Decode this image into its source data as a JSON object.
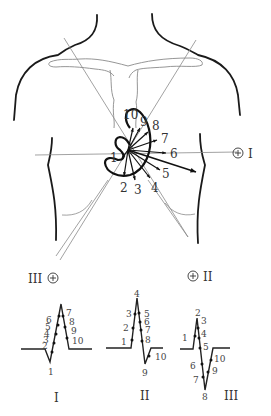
{
  "diagram": {
    "electrodes": [
      {
        "id": "I",
        "label": "I",
        "polarity": "+"
      },
      {
        "id": "II",
        "label": "II",
        "polarity": "+"
      },
      {
        "id": "III",
        "label": "III",
        "polarity": "+"
      }
    ],
    "vector_labels": [
      "1",
      "2",
      "3",
      "4",
      "5",
      "6",
      "7",
      "8",
      "9",
      "10"
    ],
    "leads": [
      {
        "name": "I",
        "point_labels": [
          "1",
          "2",
          "3",
          "4",
          "5",
          "6",
          "7",
          "8",
          "9",
          "10"
        ]
      },
      {
        "name": "II",
        "point_labels": [
          "1",
          "2",
          "3",
          "4",
          "5",
          "6",
          "7",
          "8",
          "9",
          "10"
        ]
      },
      {
        "name": "III",
        "point_labels": [
          "1",
          "2",
          "3",
          "4",
          "5",
          "6",
          "7",
          "8",
          "9",
          "10"
        ]
      }
    ],
    "colors": {
      "ink": "#111111",
      "guide": "#8a8a8a",
      "background": "#ffffff"
    }
  }
}
